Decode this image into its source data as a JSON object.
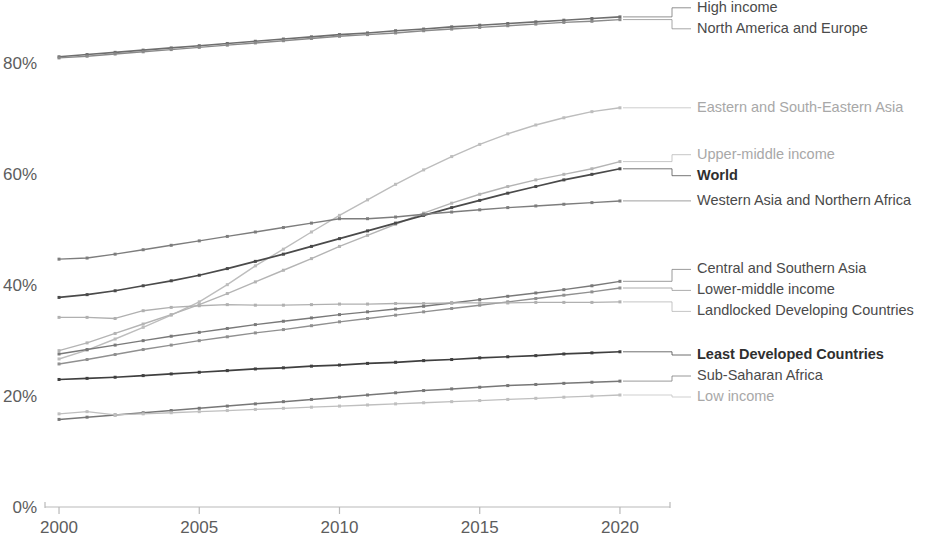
{
  "chart_data": {
    "type": "line",
    "title": "",
    "subtitle": "",
    "xlabel": "",
    "ylabel": "",
    "xlim": [
      1999.5,
      2021
    ],
    "ylim": [
      0,
      90
    ],
    "grid": false,
    "legend_position": "right-inline",
    "x": [
      2000,
      2001,
      2002,
      2003,
      2004,
      2005,
      2006,
      2007,
      2008,
      2009,
      2010,
      2011,
      2012,
      2013,
      2014,
      2015,
      2016,
      2017,
      2018,
      2019,
      2020
    ],
    "y_ticks": [
      "0%",
      "20%",
      "40%",
      "60%",
      "80%"
    ],
    "y_tick_values": [
      0,
      20,
      40,
      60,
      80
    ],
    "x_ticks": [
      "2000",
      "2005",
      "2010",
      "2015",
      "2020"
    ],
    "x_tick_values": [
      2000,
      2005,
      2010,
      2015,
      2020
    ],
    "series": [
      {
        "name": "High income",
        "color": "#6e6e6e",
        "width": 1.6,
        "dash": "none",
        "emphasis": "normal",
        "values": [
          81.2,
          81.6,
          82.0,
          82.4,
          82.8,
          83.2,
          83.6,
          84.0,
          84.4,
          84.8,
          85.2,
          85.5,
          85.9,
          86.2,
          86.6,
          86.9,
          87.2,
          87.5,
          87.8,
          88.1,
          88.4
        ]
      },
      {
        "name": "North America and Europe",
        "color": "#8a8a8a",
        "width": 1.4,
        "dash": "none",
        "emphasis": "normal",
        "values": [
          81.0,
          81.3,
          81.7,
          82.1,
          82.5,
          82.9,
          83.3,
          83.7,
          84.1,
          84.5,
          84.9,
          85.2,
          85.5,
          85.9,
          86.2,
          86.5,
          86.8,
          87.1,
          87.4,
          87.6,
          87.9
        ]
      },
      {
        "name": "Eastern and South-Eastern Asia",
        "color": "#bdbdbd",
        "width": 1.4,
        "dash": "none",
        "emphasis": "light",
        "values": [
          26.7,
          28.3,
          30.3,
          32.4,
          34.6,
          37.0,
          40.1,
          43.5,
          46.5,
          49.6,
          52.6,
          55.4,
          58.2,
          60.8,
          63.2,
          65.4,
          67.3,
          68.9,
          70.2,
          71.3,
          72.0
        ]
      },
      {
        "name": "Upper-middle income",
        "color": "#b4b4b4",
        "width": 1.4,
        "dash": "none",
        "emphasis": "light",
        "values": [
          28.2,
          29.6,
          31.3,
          33.0,
          34.7,
          36.5,
          38.5,
          40.6,
          42.7,
          44.8,
          47.0,
          49.0,
          51.0,
          53.0,
          54.8,
          56.4,
          57.8,
          59.0,
          60.0,
          61.0,
          62.3
        ]
      },
      {
        "name": "World",
        "color": "#4a4a4a",
        "width": 1.7,
        "dash": "none",
        "emphasis": "bold",
        "values": [
          37.8,
          38.3,
          39.0,
          39.9,
          40.8,
          41.8,
          43.0,
          44.3,
          45.6,
          47.0,
          48.4,
          49.8,
          51.2,
          52.6,
          54.0,
          55.3,
          56.6,
          57.8,
          59.0,
          60.0,
          61.0
        ]
      },
      {
        "name": "Western Asia and Northern Africa",
        "color": "#7d7d7d",
        "width": 1.4,
        "dash": "none",
        "emphasis": "normal",
        "values": [
          44.7,
          44.9,
          45.6,
          46.4,
          47.2,
          48.0,
          48.8,
          49.6,
          50.4,
          51.2,
          52.0,
          52.0,
          52.3,
          52.8,
          53.2,
          53.6,
          54.0,
          54.3,
          54.6,
          54.9,
          55.2
        ]
      },
      {
        "name": "Central and Southern Asia",
        "color": "#797979",
        "width": 1.4,
        "dash": "none",
        "emphasis": "normal",
        "values": [
          27.6,
          28.4,
          29.2,
          30.0,
          30.8,
          31.5,
          32.2,
          32.9,
          33.5,
          34.1,
          34.7,
          35.2,
          35.7,
          36.2,
          36.8,
          37.4,
          38.0,
          38.6,
          39.2,
          39.9,
          40.7
        ]
      },
      {
        "name": "Lower-middle income",
        "color": "#909090",
        "width": 1.4,
        "dash": "none",
        "emphasis": "normal",
        "values": [
          25.8,
          26.6,
          27.5,
          28.4,
          29.2,
          30.0,
          30.7,
          31.4,
          32.0,
          32.7,
          33.4,
          34.0,
          34.6,
          35.2,
          35.8,
          36.4,
          37.0,
          37.6,
          38.2,
          38.8,
          39.5
        ]
      },
      {
        "name": "Landlocked Developing Countries",
        "color": "#b0b0b0",
        "width": 1.3,
        "dash": "none",
        "emphasis": "light",
        "values": [
          34.2,
          34.2,
          34.0,
          35.4,
          36.0,
          36.3,
          36.5,
          36.4,
          36.4,
          36.5,
          36.6,
          36.6,
          36.7,
          36.7,
          36.8,
          36.8,
          36.8,
          36.9,
          36.9,
          36.9,
          37.0
        ]
      },
      {
        "name": "Least Developed Countries",
        "color": "#3f3f3f",
        "width": 1.7,
        "dash": "none",
        "emphasis": "bold",
        "values": [
          23.0,
          23.2,
          23.4,
          23.7,
          24.0,
          24.3,
          24.6,
          24.9,
          25.1,
          25.4,
          25.6,
          25.9,
          26.1,
          26.4,
          26.6,
          26.9,
          27.1,
          27.3,
          27.6,
          27.8,
          28.0
        ]
      },
      {
        "name": "Sub-Saharan Africa",
        "color": "#777777",
        "width": 1.5,
        "dash": "none",
        "emphasis": "normal",
        "values": [
          15.8,
          16.2,
          16.6,
          17.0,
          17.4,
          17.8,
          18.2,
          18.6,
          19.0,
          19.4,
          19.8,
          20.2,
          20.6,
          21.0,
          21.3,
          21.6,
          21.9,
          22.1,
          22.3,
          22.5,
          22.7
        ]
      },
      {
        "name": "Low income",
        "color": "#bfbfbf",
        "width": 1.3,
        "dash": "none",
        "emphasis": "light",
        "values": [
          16.8,
          17.2,
          16.6,
          16.8,
          17.0,
          17.2,
          17.4,
          17.6,
          17.8,
          18.0,
          18.2,
          18.4,
          18.6,
          18.8,
          19.0,
          19.2,
          19.4,
          19.6,
          19.8,
          20.0,
          20.2
        ]
      }
    ]
  },
  "legend": {
    "groups": [
      {
        "items": [
          {
            "label": "High income",
            "style": "normal",
            "anchor_value": 88.4
          },
          {
            "label": "North America and Europe",
            "style": "normal",
            "anchor_value": 87.9
          }
        ]
      },
      {
        "items": [
          {
            "label": "Eastern and South-Eastern Asia",
            "style": "light",
            "anchor_value": 72.0
          }
        ]
      },
      {
        "items": [
          {
            "label": "Upper-middle income",
            "style": "light",
            "anchor_value": 62.3
          },
          {
            "label": "World",
            "style": "bold",
            "anchor_value": 61.0
          }
        ]
      },
      {
        "items": [
          {
            "label": "Western Asia and Northern Africa",
            "style": "normal",
            "anchor_value": 55.2
          }
        ]
      },
      {
        "items": [
          {
            "label": "Central and Southern Asia",
            "style": "normal",
            "anchor_value": 40.7
          },
          {
            "label": "Lower-middle income",
            "style": "normal",
            "anchor_value": 39.5
          },
          {
            "label": "Landlocked Developing Countries",
            "style": "normal",
            "anchor_value": 37.0
          }
        ]
      },
      {
        "items": [
          {
            "label": "Least Developed Countries",
            "style": "bold",
            "anchor_value": 28.0
          },
          {
            "label": "Sub-Saharan Africa",
            "style": "normal",
            "anchor_value": 22.7
          },
          {
            "label": "Low income",
            "style": "light",
            "anchor_value": 20.2
          }
        ]
      }
    ]
  }
}
